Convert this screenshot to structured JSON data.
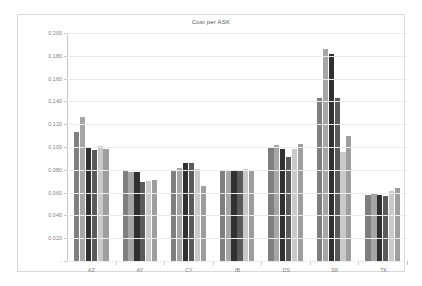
{
  "chart_data": {
    "type": "bar",
    "title": "Cost per ASK",
    "xlabel": "",
    "ylabel": "",
    "ylim": [
      0.0,
      0.2
    ],
    "ytick_step": 0.02,
    "grid": true,
    "legend": "none",
    "decimal_separator": ",",
    "ytick_labels": [
      "0,200",
      "0,180",
      "0,160",
      "0,140",
      "0,120",
      "0,100",
      "0,080",
      "0,060",
      "0,040",
      "0,020",
      "-"
    ],
    "ytick_values": [
      0.2,
      0.18,
      0.16,
      0.14,
      0.12,
      0.1,
      0.08,
      0.06,
      0.04,
      0.02,
      0.0
    ],
    "categories": [
      "AZ",
      "AY",
      "CY",
      "IB",
      "DS",
      "SK",
      "TK"
    ],
    "series": [
      {
        "name": "S1",
        "color": "#7f7f7f",
        "values": [
          0.113,
          0.079,
          0.079,
          0.08,
          0.1,
          0.143,
          0.058
        ]
      },
      {
        "name": "S2",
        "color": "#a6a6a6",
        "values": [
          0.126,
          0.078,
          0.082,
          0.079,
          0.102,
          0.186,
          0.06
        ]
      },
      {
        "name": "S3",
        "color": "#303030",
        "values": [
          0.099,
          0.078,
          0.086,
          0.08,
          0.098,
          0.182,
          0.058
        ]
      },
      {
        "name": "S4",
        "color": "#5a5a5a",
        "values": [
          0.097,
          0.069,
          0.086,
          0.079,
          0.091,
          0.143,
          0.057
        ]
      },
      {
        "name": "S5",
        "color": "#c9c9c9",
        "values": [
          0.101,
          0.07,
          0.081,
          0.081,
          0.098,
          0.096,
          0.061
        ]
      },
      {
        "name": "S6",
        "color": "#9e9e9e",
        "values": [
          0.098,
          0.071,
          0.066,
          0.079,
          0.103,
          0.11,
          0.064
        ]
      }
    ]
  },
  "styling": {
    "frame_color": "#d9d9d9",
    "axis_color": "#c8c8c8",
    "grid_color": "#ececec",
    "tick_text_color": "#7f7f7f",
    "title_color": "#595959",
    "plot_background": "#ffffff"
  }
}
